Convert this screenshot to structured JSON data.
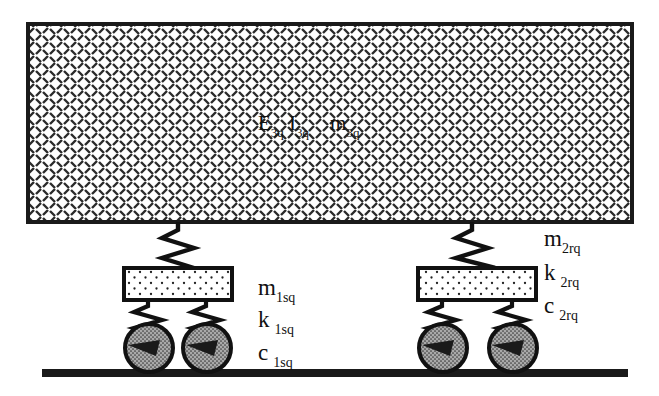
{
  "figure": {
    "background_color": "#ffffff",
    "ink_color": "#111111"
  },
  "beam": {
    "name": "flexible beam",
    "fill_pattern": "diagonal-dash-crosshatch",
    "fill_color": "#ffffff",
    "border_color": "#1a1a1a",
    "label": {
      "stiffness_symbol": "E",
      "stiffness_subscript": "3q",
      "inertia_symbol": "I",
      "inertia_subscript": "3q",
      "mass_symbol": "m",
      "mass_subscript": "3q"
    }
  },
  "ground": {
    "name": "rigid ground line",
    "color": "#1a1a1a"
  },
  "axles": [
    {
      "id": "front-axle",
      "label_side": "right-of-assembly",
      "mass_symbol": "m",
      "mass_subscript": "1sq",
      "stiffness_symbol": "k",
      "stiffness_subscript": "1sq",
      "damping_symbol": "c",
      "damping_subscript": "1sq",
      "block_fill_pattern": "dotted",
      "block_fill_color": "#ffffff",
      "wheel_fill_color": "#9a9a9a",
      "wheel_count": 2
    },
    {
      "id": "rear-axle",
      "label_side": "right-of-figure",
      "mass_symbol": "m",
      "mass_subscript": "2rq",
      "stiffness_symbol": "k",
      "stiffness_subscript": "2rq",
      "damping_symbol": "c",
      "damping_subscript": "2rq",
      "block_fill_pattern": "dotted",
      "block_fill_color": "#ffffff",
      "wheel_fill_color": "#9a9a9a",
      "wheel_count": 2
    }
  ],
  "springs": {
    "name": "helical coil springs",
    "color": "#111111",
    "upper_count": 2,
    "lower_count": 4
  }
}
